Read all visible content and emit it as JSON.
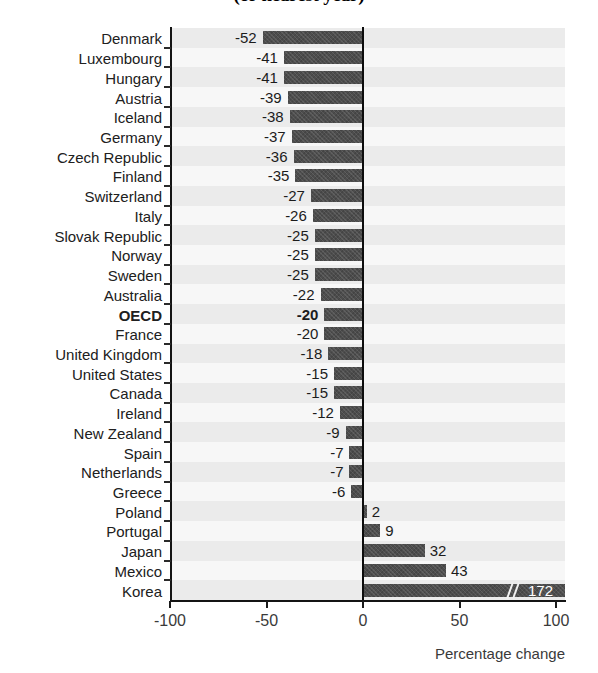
{
  "title": "(or nearest year)",
  "axis": {
    "x_title": "Percentage change",
    "ticks": [
      "-100",
      "-50",
      "0",
      "50",
      "100"
    ]
  },
  "colors": {
    "bar": "#4d4d4d",
    "zero_line": "#0d0d0d",
    "plot_background": "#f4f4f4",
    "band": "#ebebeb"
  },
  "chart_data": {
    "type": "bar",
    "orientation": "horizontal",
    "title": "(or nearest year)",
    "xlabel": "Percentage change",
    "ylabel": "",
    "xlim": [
      -100,
      110
    ],
    "xticks": [
      -100,
      -50,
      0,
      50,
      100
    ],
    "grid": false,
    "legend": "none",
    "axis_break": {
      "present": true,
      "series_item": "Korea",
      "note": "Korea bar is truncated with a // break mark; true value 172 exceeds axis maximum"
    },
    "categories": [
      "Denmark",
      "Luxembourg",
      "Hungary",
      "Austria",
      "Iceland",
      "Germany",
      "Czech Republic",
      "Finland",
      "Switzerland",
      "Italy",
      "Slovak Republic",
      "Norway",
      "Sweden",
      "Australia",
      "OECD",
      "France",
      "United Kingdom",
      "United States",
      "Canada",
      "Ireland",
      "New Zealand",
      "Spain",
      "Netherlands",
      "Greece",
      "Poland",
      "Portugal",
      "Japan",
      "Mexico",
      "Korea"
    ],
    "values": [
      -52,
      -41,
      -41,
      -39,
      -38,
      -37,
      -36,
      -35,
      -27,
      -26,
      -25,
      -25,
      -25,
      -22,
      -20,
      -20,
      -18,
      -15,
      -15,
      -12,
      -9,
      -7,
      -7,
      -6,
      2,
      9,
      32,
      43,
      172
    ],
    "highlight": "OECD"
  },
  "rows": [
    {
      "label": "Denmark",
      "value": -52,
      "text": "-52",
      "bold": false
    },
    {
      "label": "Luxembourg",
      "value": -41,
      "text": "-41",
      "bold": false
    },
    {
      "label": "Hungary",
      "value": -41,
      "text": "-41",
      "bold": false
    },
    {
      "label": "Austria",
      "value": -39,
      "text": "-39",
      "bold": false
    },
    {
      "label": "Iceland",
      "value": -38,
      "text": "-38",
      "bold": false
    },
    {
      "label": "Germany",
      "value": -37,
      "text": "-37",
      "bold": false
    },
    {
      "label": "Czech Republic",
      "value": -36,
      "text": "-36",
      "bold": false
    },
    {
      "label": "Finland",
      "value": -35,
      "text": "-35",
      "bold": false
    },
    {
      "label": "Switzerland",
      "value": -27,
      "text": "-27",
      "bold": false
    },
    {
      "label": "Italy",
      "value": -26,
      "text": "-26",
      "bold": false
    },
    {
      "label": "Slovak Republic",
      "value": -25,
      "text": "-25",
      "bold": false
    },
    {
      "label": "Norway",
      "value": -25,
      "text": "-25",
      "bold": false
    },
    {
      "label": "Sweden",
      "value": -25,
      "text": "-25",
      "bold": false
    },
    {
      "label": "Australia",
      "value": -22,
      "text": "-22",
      "bold": false
    },
    {
      "label": "OECD",
      "value": -20,
      "text": "-20",
      "bold": true
    },
    {
      "label": "France",
      "value": -20,
      "text": "-20",
      "bold": false
    },
    {
      "label": "United Kingdom",
      "value": -18,
      "text": "-18",
      "bold": false
    },
    {
      "label": "United States",
      "value": -15,
      "text": "-15",
      "bold": false
    },
    {
      "label": "Canada",
      "value": -15,
      "text": "-15",
      "bold": false
    },
    {
      "label": "Ireland",
      "value": -12,
      "text": "-12",
      "bold": false
    },
    {
      "label": "New Zealand",
      "value": -9,
      "text": "-9",
      "bold": false
    },
    {
      "label": "Spain",
      "value": -7,
      "text": "-7",
      "bold": false
    },
    {
      "label": "Netherlands",
      "value": -7,
      "text": "-7",
      "bold": false
    },
    {
      "label": "Greece",
      "value": -6,
      "text": "-6",
      "bold": false
    },
    {
      "label": "Poland",
      "value": 2,
      "text": "2",
      "bold": false
    },
    {
      "label": "Portugal",
      "value": 9,
      "text": "9",
      "bold": false
    },
    {
      "label": "Japan",
      "value": 32,
      "text": "32",
      "bold": false
    },
    {
      "label": "Mexico",
      "value": 43,
      "text": "43",
      "bold": false
    },
    {
      "label": "Korea",
      "value": 172,
      "text": "172",
      "bold": false,
      "clipped": true
    }
  ]
}
